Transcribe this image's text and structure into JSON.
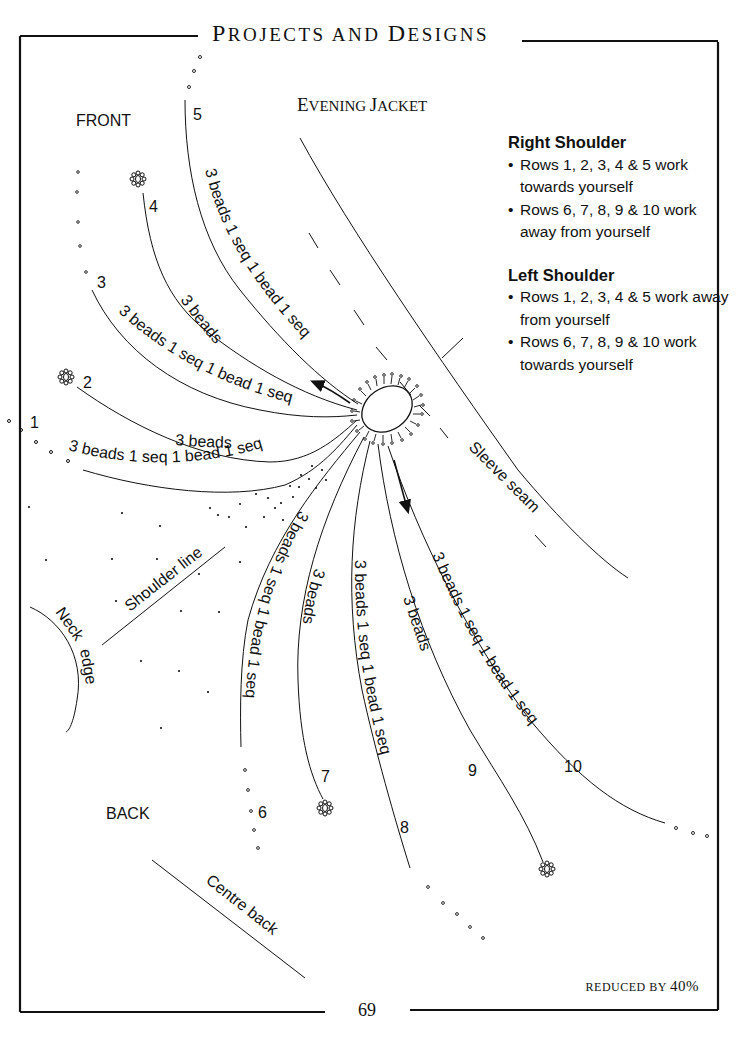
{
  "header": {
    "running_head_p": "P",
    "running_head_rest1": "ROJECTS AND ",
    "running_head_d": "D",
    "running_head_rest2": "ESIGNS"
  },
  "diagram": {
    "title_e": "E",
    "title_rest1": "VENING ",
    "title_j": "J",
    "title_rest2": "ACKET",
    "labels": {
      "front": "FRONT",
      "back": "BACK",
      "sleeve_seam": "Sleeve seam",
      "shoulder_line": "Shoulder line",
      "neck_edge_1": "Neck",
      "neck_edge_2": "edge",
      "centre_back": "Centre back"
    },
    "rows": [
      {
        "number": "1",
        "pattern": "3 beads 1 seq 1 bead 1 seq",
        "end": "beads"
      },
      {
        "number": "2",
        "pattern": "3 beads",
        "end": "flower"
      },
      {
        "number": "3",
        "pattern": "3 beads 1 seq 1 bead 1 seq",
        "end": "beads"
      },
      {
        "number": "4",
        "pattern": "3 beads",
        "end": "flower"
      },
      {
        "number": "5",
        "pattern": "3 beads 1 seq 1 bead 1 seq",
        "end": "beads"
      },
      {
        "number": "6",
        "pattern": "3 beads 1 seq 1 bead 1 seq",
        "end": "beads"
      },
      {
        "number": "7",
        "pattern": "3 beads",
        "end": "flower"
      },
      {
        "number": "8",
        "pattern": "3 beads 1 seq 1 bead 1 seq",
        "end": "beads"
      },
      {
        "number": "9",
        "pattern": "3 beads",
        "end": "flower"
      },
      {
        "number": "10",
        "pattern": "3 beads 1 seq 1 bead 1 seq",
        "end": "beads"
      }
    ]
  },
  "legend": {
    "right_shoulder": {
      "heading": "Right Shoulder",
      "items": [
        "Rows 1, 2, 3, 4 & 5 work towards yourself",
        "Rows 6, 7, 8, 9 & 10 work away from yourself"
      ]
    },
    "left_shoulder": {
      "heading": "Left Shoulder",
      "items": [
        "Rows 1, 2, 3, 4 & 5 work away from yourself",
        "Rows 6, 7, 8, 9 & 10 work towards yourself"
      ]
    }
  },
  "footer": {
    "reduced_text": "REDUCED BY ",
    "reduced_pct": "40%",
    "page_number": "69"
  }
}
